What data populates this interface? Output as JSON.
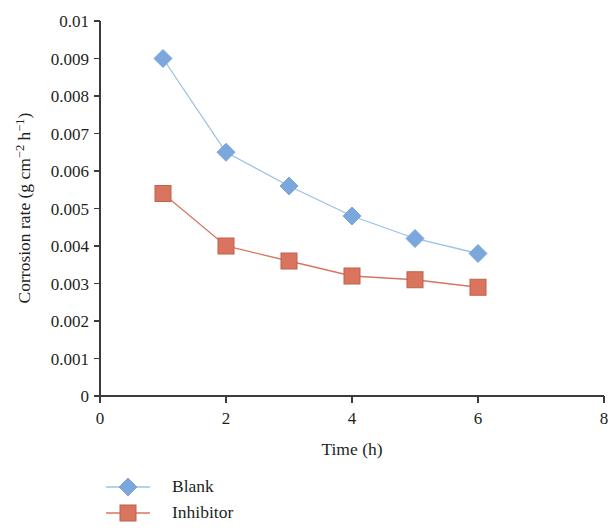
{
  "chart_data": {
    "type": "line",
    "title": "",
    "xlabel": "Time (h)",
    "ylabel": "Corrosion rate (g cm−2 h−1)",
    "ylabel_parts": {
      "prefix": "Corrosion rate (g cm",
      "sup1": "−2",
      "mid": " h",
      "sup2": "−1",
      "suffix": ")"
    },
    "x": [
      1,
      2,
      3,
      4,
      5,
      6
    ],
    "xlim": [
      0,
      8
    ],
    "ylim": [
      0,
      0.01
    ],
    "xticks": [
      "0",
      "2",
      "4",
      "6",
      "8"
    ],
    "xtick_values": [
      0,
      2,
      4,
      6,
      8
    ],
    "yticks": [
      "0",
      "0.001",
      "0.002",
      "0.003",
      "0.004",
      "0.005",
      "0.006",
      "0.007",
      "0.008",
      "0.009",
      "0.01"
    ],
    "ytick_values": [
      0,
      0.001,
      0.002,
      0.003,
      0.004,
      0.005,
      0.006,
      0.007,
      0.008,
      0.009,
      0.01
    ],
    "grid": false,
    "legend_position": "bottom-left",
    "series": [
      {
        "name": "Blank",
        "marker": "diamond",
        "color": "#7ba7dc",
        "line_color": "#9cc2e5",
        "values": [
          0.009,
          0.0065,
          0.0056,
          0.0048,
          0.0042,
          0.0038
        ]
      },
      {
        "name": "Inhibitor",
        "marker": "square",
        "color": "#d9755f",
        "line_color": "#d9755f",
        "values": [
          0.0054,
          0.004,
          0.0036,
          0.0032,
          0.0031,
          0.0029
        ]
      }
    ]
  },
  "legend": {
    "items": [
      {
        "label": "Blank",
        "marker": "diamond-marker",
        "color": "#7ba7dc"
      },
      {
        "label": "Inhibitor",
        "marker": "square-marker",
        "color": "#d9755f"
      }
    ]
  }
}
